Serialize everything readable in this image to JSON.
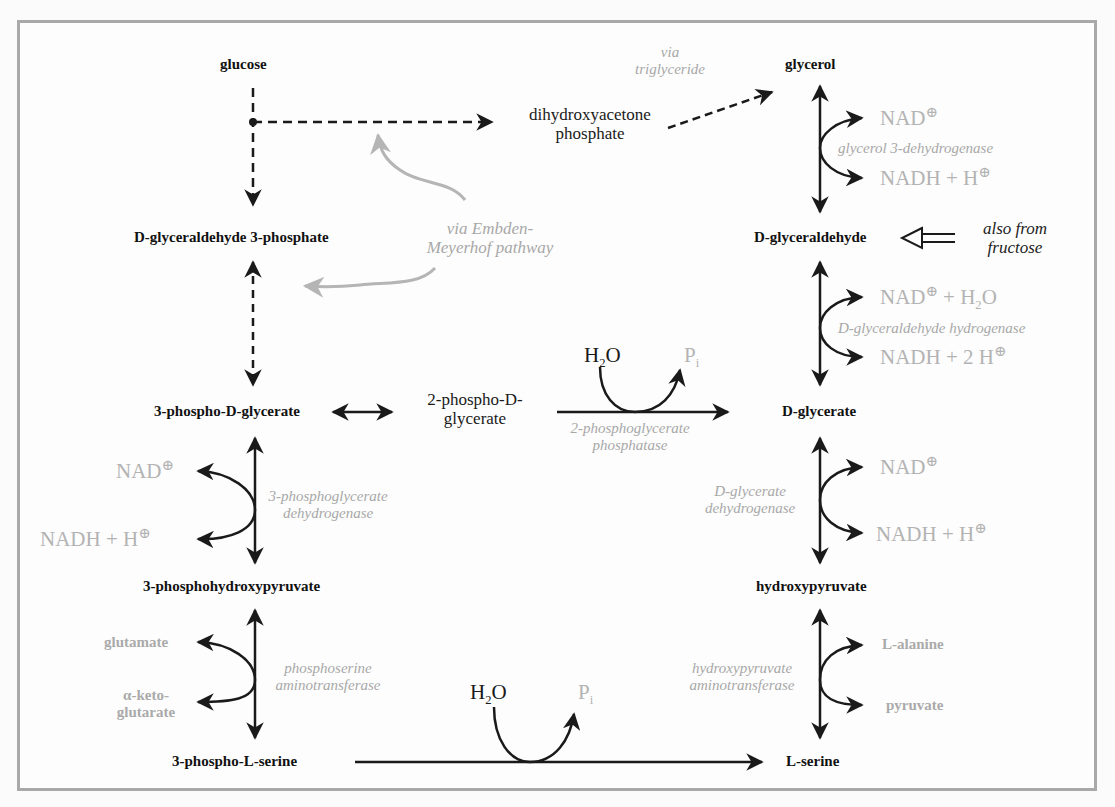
{
  "diagram": {
    "nodes": {
      "glucose": "glucose",
      "dhap_line1": "dihydroxyacetone",
      "dhap_line2": "phosphate",
      "glycerol": "glycerol",
      "g3p_prefix": "D",
      "g3p_rest": "-glyceraldehyde 3-phosphate",
      "glyceraldehyde_prefix": "D",
      "glyceraldehyde_rest": "-glyceraldehyde",
      "pg3_a": "3-phospho-",
      "pg3_prefix": "D",
      "pg3_rest": "-glycerate",
      "pg2_line1_a": "2-phospho-",
      "pg2_line1_prefix": "D",
      "pg2_line1_b": "-",
      "pg2_line2": "glycerate",
      "glycerate_prefix": "D",
      "glycerate_rest": "-glycerate",
      "phpyr": "3-phosphohydroxypyruvate",
      "hpyr": "hydroxypyruvate",
      "pser_a": "3-phospho-",
      "pser_prefix": "L",
      "pser_rest": "-serine",
      "ser_prefix": "L",
      "ser_rest": "-serine"
    },
    "annotations": {
      "via_tg_line1": "via",
      "via_tg_line2": "triglyceride",
      "via_em_line1": "via Embden-",
      "via_em_line2": "Meyerhof pathway",
      "fructose_line1": "also from",
      "fructose_line2": "fructose"
    },
    "enzymes": {
      "glycerol_dh": "glycerol 3-dehydrogenase",
      "glyceraldehyde_h_prefix": "D",
      "glyceraldehyde_h_rest": "-glyceraldehyde hydrogenase",
      "pgp_line1": "2-phosphoglycerate",
      "pgp_line2": "phosphatase",
      "pgdh_line1": "3-phosphoglycerate",
      "pgdh_line2": "dehydrogenase",
      "gdh_line1_prefix": "D",
      "gdh_line1_rest": "-glycerate",
      "gdh_line2": "dehydrogenase",
      "psat_line1": "phosphoserine",
      "psat_line2": "aminotransferase",
      "hpat_line1": "hydroxypyruvate",
      "hpat_line2": "aminotransferase"
    },
    "cofactors": {
      "nad": "NAD",
      "nadh_h": "NADH + H",
      "nad_h2o_a": "NAD",
      "nad_h2o_b": " + H",
      "nad_h2o_c": "O",
      "nadh_2h": "NADH + 2 H",
      "plus_sign": "⊕",
      "h2o_a": "H",
      "h2o_sub": "2",
      "h2o_b": "O",
      "pi_a": "P",
      "pi_sub": "i",
      "glutamate": "glutamate",
      "aketo_line1": "α-keto-",
      "aketo_line2": "glutarate",
      "alanine_prefix": "L",
      "alanine_rest": "-alanine",
      "pyruvate": "pyruvate"
    },
    "colors": {
      "frame": "#a9a9a9",
      "arrow": "#1a1a1a",
      "gray_annotation": "#aaaaaa",
      "curved_hint": "#b5b5b5"
    }
  }
}
